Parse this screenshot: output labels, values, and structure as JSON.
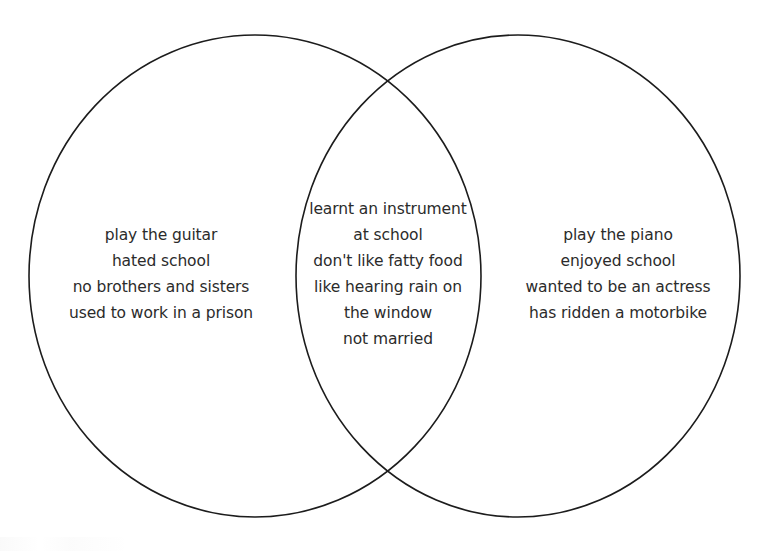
{
  "diagram": {
    "type": "venn",
    "set_count": 2,
    "stroke_color": "#1c1c1c",
    "text_color": "#2b2b2b",
    "background_color": "#ffffff",
    "left_set": {
      "lines": [
        "play the guitar",
        "hated school",
        "no brothers and sisters",
        "used to work in a prison"
      ]
    },
    "intersection": {
      "lines": [
        "learnt an instrument",
        "at school",
        "don't like fatty food",
        "like hearing rain on",
        "the window",
        "not married"
      ]
    },
    "right_set": {
      "lines": [
        "play the piano",
        "enjoyed school",
        "wanted to be an actress",
        "has ridden a motorbike"
      ]
    }
  }
}
